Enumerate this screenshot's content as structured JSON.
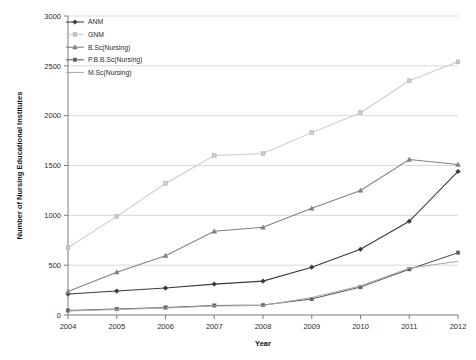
{
  "chart_data": {
    "type": "line",
    "title": "",
    "xlabel": "Year",
    "ylabel": "Number of Nursing Educational Institutes",
    "categories": [
      "2004",
      "2005",
      "2006",
      "2007",
      "2008",
      "2009",
      "2010",
      "2011",
      "2012"
    ],
    "x": [
      2004,
      2005,
      2006,
      2007,
      2008,
      2009,
      2010,
      2011,
      2012
    ],
    "ylim": [
      0,
      3000
    ],
    "ytick_labels": [
      "0",
      "500",
      "1000",
      "1500",
      "2000",
      "2500",
      "3000"
    ],
    "ytick_values": [
      0,
      500,
      1000,
      1500,
      2000,
      2500,
      3000
    ],
    "grid": true,
    "legend_position": "top-left",
    "series": [
      {
        "name": "ANM",
        "color": "#3a3a3a",
        "marker": "diamond",
        "values": [
          210,
          240,
          270,
          310,
          340,
          480,
          660,
          940,
          1440
        ]
      },
      {
        "name": "GNM",
        "color": "#cccccc",
        "marker": "square",
        "values": [
          675,
          990,
          1320,
          1600,
          1620,
          1830,
          2030,
          2350,
          2540
        ]
      },
      {
        "name": "B.Sc(Nursing)",
        "color": "#808080",
        "marker": "triangle",
        "values": [
          235,
          430,
          595,
          840,
          880,
          1070,
          1250,
          1560,
          1510
        ]
      },
      {
        "name": "P.B.B.Sc(Nursing)",
        "color": "#5a5a5a",
        "marker": "square",
        "values": [
          45,
          60,
          75,
          95,
          100,
          160,
          280,
          460,
          625
        ]
      },
      {
        "name": "M.Sc(Nursing)",
        "color": "#a8a8a8",
        "marker": "none",
        "values": [
          40,
          55,
          70,
          90,
          95,
          175,
          290,
          470,
          540
        ]
      }
    ]
  }
}
